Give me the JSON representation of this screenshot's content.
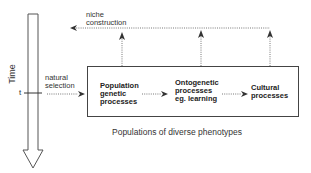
{
  "diagram": {
    "axis": {
      "label": "Time",
      "tick_label": "t"
    },
    "feedback": {
      "label_line1": "niche",
      "label_line2": "construction"
    },
    "input": {
      "label_line1": "natural",
      "label_line2": "selection"
    },
    "processes": [
      {
        "line1": "Population",
        "line2": "genetic",
        "line3": "processes"
      },
      {
        "line1": "Ontogenetic",
        "line2": "processes",
        "line3": "eg. learning"
      },
      {
        "line1": "Cultural",
        "line2": "processes"
      }
    ],
    "caption": "Populations of diverse phenotypes",
    "colors": {
      "line": "#444444",
      "text": "#222222",
      "background": "#ffffff"
    }
  }
}
